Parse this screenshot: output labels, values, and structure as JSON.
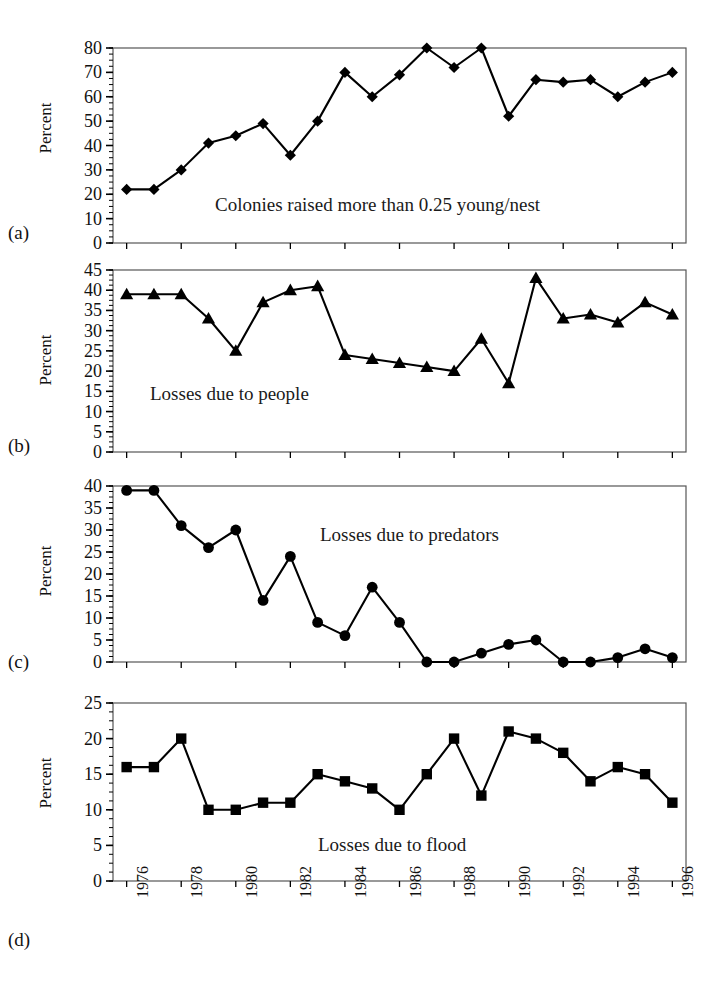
{
  "figure": {
    "ylabel": "Percent",
    "panel_letters": [
      "(a)",
      "(b)",
      "(c)",
      "(d)"
    ],
    "axis_color": "#000000",
    "line_color": "#000000",
    "background": "#ffffff"
  },
  "chart_data": [
    {
      "type": "line",
      "panel": "(a)",
      "title": "",
      "annotation": "Colonies raised more than 0.25 young/nest",
      "marker": "diamond",
      "xlabel": "",
      "ylabel": "Percent",
      "xlim": [
        1975.5,
        1996.5
      ],
      "ylim": [
        0,
        80
      ],
      "ytick_step": 10,
      "yticks": [
        0,
        10,
        20,
        30,
        40,
        50,
        60,
        70,
        80
      ],
      "minor_ytick_step": 2.5,
      "grid": false,
      "x": [
        1976,
        1977,
        1978,
        1979,
        1980,
        1981,
        1982,
        1983,
        1984,
        1985,
        1986,
        1987,
        1988,
        1989,
        1990,
        1991,
        1992,
        1993,
        1994,
        1995,
        1996
      ],
      "values": [
        22,
        22,
        30,
        41,
        44,
        49,
        36,
        50,
        70,
        60,
        69,
        80,
        72,
        80,
        52,
        67,
        66,
        67,
        60,
        66,
        70
      ]
    },
    {
      "type": "line",
      "panel": "(b)",
      "title": "",
      "annotation": "Losses due to people",
      "marker": "triangle",
      "xlabel": "",
      "ylabel": "Percent",
      "xlim": [
        1975.5,
        1996.5
      ],
      "ylim": [
        0,
        45
      ],
      "ytick_step": 5,
      "yticks": [
        0,
        5,
        10,
        15,
        20,
        25,
        30,
        35,
        40,
        45
      ],
      "minor_ytick_step": 1.25,
      "grid": false,
      "x": [
        1976,
        1977,
        1978,
        1979,
        1980,
        1981,
        1982,
        1983,
        1984,
        1985,
        1986,
        1987,
        1988,
        1989,
        1990,
        1991,
        1992,
        1993,
        1994,
        1995,
        1996
      ],
      "values": [
        39,
        39,
        39,
        33,
        25,
        37,
        40,
        41,
        24,
        23,
        22,
        21,
        20,
        28,
        17,
        43,
        33,
        34,
        32,
        37,
        34,
        26
      ]
    },
    {
      "type": "line",
      "panel": "(c)",
      "title": "",
      "annotation": "Losses due to predators",
      "marker": "circle",
      "xlabel": "",
      "ylabel": "Percent",
      "xlim": [
        1975.5,
        1996.5
      ],
      "ylim": [
        0,
        40
      ],
      "ytick_step": 5,
      "yticks": [
        0,
        5,
        10,
        15,
        20,
        25,
        30,
        35,
        40
      ],
      "minor_ytick_step": 1.25,
      "grid": false,
      "x": [
        1976,
        1977,
        1978,
        1979,
        1980,
        1981,
        1982,
        1983,
        1984,
        1985,
        1986,
        1987,
        1988,
        1989,
        1990,
        1991,
        1992,
        1993,
        1994,
        1995,
        1996
      ],
      "values": [
        39,
        39,
        31,
        26,
        30,
        14,
        24,
        9,
        6,
        17,
        9,
        0,
        0,
        2,
        4,
        5,
        0,
        0,
        1,
        3,
        1,
        4
      ]
    },
    {
      "type": "line",
      "panel": "(d)",
      "title": "",
      "annotation": "Losses due to flood",
      "marker": "square",
      "xlabel": "",
      "ylabel": "Percent",
      "xlim": [
        1975.5,
        1996.5
      ],
      "ylim": [
        0,
        25
      ],
      "ytick_step": 5,
      "yticks": [
        0,
        5,
        10,
        15,
        20,
        25
      ],
      "minor_ytick_step": 1.25,
      "grid": false,
      "x": [
        1976,
        1977,
        1978,
        1979,
        1980,
        1981,
        1982,
        1983,
        1984,
        1985,
        1986,
        1987,
        1988,
        1989,
        1990,
        1991,
        1992,
        1993,
        1994,
        1995,
        1996
      ],
      "values": [
        16,
        16,
        20,
        10,
        10,
        11,
        11,
        15,
        14,
        13,
        10,
        15,
        20,
        12,
        21,
        20,
        18,
        14,
        16,
        15,
        11
      ]
    }
  ],
  "xaxis": {
    "tick_labels": [
      "1976",
      "1978",
      "1980",
      "1982",
      "1984",
      "1986",
      "1988",
      "1990",
      "1992",
      "1994",
      "1996"
    ],
    "tick_years": [
      1976,
      1978,
      1980,
      1982,
      1984,
      1986,
      1988,
      1990,
      1992,
      1994,
      1996
    ],
    "all_years": [
      1976,
      1977,
      1978,
      1979,
      1980,
      1981,
      1982,
      1983,
      1984,
      1985,
      1986,
      1987,
      1988,
      1989,
      1990,
      1991,
      1992,
      1993,
      1994,
      1995,
      1996
    ],
    "rotation_deg": -90,
    "range": [
      1975.5,
      1996.5
    ]
  }
}
